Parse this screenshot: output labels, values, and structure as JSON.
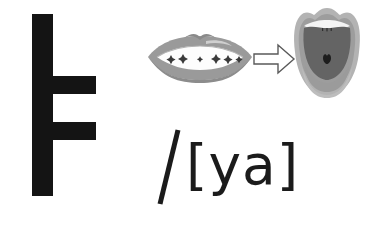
{
  "page": {
    "background_color": "#ffffff",
    "width": 386,
    "height": 225
  },
  "letter": {
    "name": "hangul-vowel-ya",
    "glyph": "ㅟ",
    "romanization": "ya",
    "color": "#141414",
    "strokes": [
      {
        "name": "vertical-stem",
        "orientation": "vertical"
      },
      {
        "name": "upper-branch",
        "orientation": "horizontal"
      },
      {
        "name": "lower-branch",
        "orientation": "horizontal"
      }
    ]
  },
  "lips": {
    "name": "lip-shape-diagram",
    "caption": "",
    "lip_color": "#9a9a9a",
    "lip_shadow_color": "#8a8a8a",
    "lip_highlight_color": "#cfcfcf",
    "mouth_opening_color": "#fdfdfd",
    "teeth_mark_color": "#3a3a3a",
    "teeth_mark_count": 6
  },
  "arrow": {
    "name": "transition-arrow",
    "direction": "right",
    "stroke_color": "#5a5a5a",
    "fill_color": "#ffffff"
  },
  "open_mouth": {
    "name": "open-mouth-diagram",
    "outer_lip_color": "#b3b3b3",
    "inner_lip_color": "#9d9d9d",
    "oral_cavity_color": "#646464",
    "tongue_color": "#9b9b9b",
    "teeth_color": "#f4f4f4",
    "uvula_color": "#1d1d1d"
  },
  "phonetic": {
    "name": "phonetic-transcription",
    "slash": "/",
    "open_bracket": "[",
    "value": "ya",
    "close_bracket": "]",
    "full_text": "[ya]",
    "color": "#1b1b1b"
  }
}
